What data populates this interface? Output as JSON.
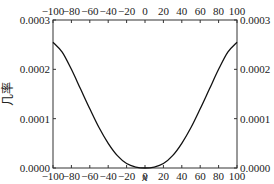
{
  "chart_data": {
    "type": "line",
    "title": "",
    "xlabel": "x",
    "ylabel": "几率",
    "xlim": [
      -100,
      100
    ],
    "ylim": [
      0.0,
      0.0003
    ],
    "grid": false,
    "legend": null,
    "x_ticks": [
      -100,
      -80,
      -60,
      -40,
      -20,
      0,
      20,
      40,
      60,
      80,
      100
    ],
    "x_tick_labels": [
      "-100",
      "-80",
      "-60",
      "-40",
      "-20",
      "0",
      "20",
      "40",
      "60",
      "80",
      "100"
    ],
    "y_ticks": [
      0.0,
      0.0001,
      0.0002,
      0.0003
    ],
    "y_tick_labels": [
      "0.0000",
      "0.0001",
      "0.0002",
      "0.0003"
    ],
    "mirrored_axes": {
      "top_x_ticks": true,
      "right_y_ticks": true
    },
    "series": [
      {
        "name": "probability",
        "color": "#111111",
        "x": [
          -100,
          -90,
          -80,
          -70,
          -60,
          -50,
          -40,
          -30,
          -20,
          -10,
          0,
          10,
          20,
          30,
          40,
          50,
          60,
          70,
          80,
          90,
          100
        ],
        "y": [
          0.000255,
          0.000235,
          0.0002,
          0.00016,
          0.00012,
          8.2e-05,
          5e-05,
          2.5e-05,
          9e-06,
          2e-06,
          0.0,
          2e-06,
          9e-06,
          2.5e-05,
          5e-05,
          8.2e-05,
          0.00012,
          0.00016,
          0.0002,
          0.000235,
          0.000255
        ]
      }
    ]
  }
}
